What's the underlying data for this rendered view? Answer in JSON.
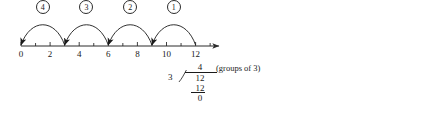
{
  "diagram": {
    "numberline": {
      "start_value": 0,
      "end_value": 12,
      "axis_end_value": 13.6,
      "tick_step": 1,
      "labeled_step": 2,
      "labels": [
        "0",
        "2",
        "4",
        "6",
        "8",
        "10",
        "12"
      ],
      "label_values": [
        0,
        2,
        4,
        6,
        8,
        10,
        12
      ],
      "all_tick_values": [
        0,
        1,
        2,
        3,
        4,
        5,
        6,
        7,
        8,
        9,
        10,
        11,
        12,
        13
      ],
      "axis_color": "#2b2b2b",
      "arrow_direction": "right"
    },
    "hops": [
      {
        "label": "4",
        "from_value": 3,
        "to_value": 0,
        "arrow_at": "to"
      },
      {
        "label": "3",
        "from_value": 6,
        "to_value": 3,
        "arrow_at": "to"
      },
      {
        "label": "2",
        "from_value": 9,
        "to_value": 6,
        "arrow_at": "to"
      },
      {
        "label": "1",
        "from_value": 12,
        "to_value": 9,
        "arrow_at": "to"
      }
    ],
    "long_division": {
      "divisor": "3",
      "dividend": "12",
      "quotient": "4",
      "subtrahend": "12",
      "remainder": "0",
      "note": "(groups of 3)"
    }
  }
}
